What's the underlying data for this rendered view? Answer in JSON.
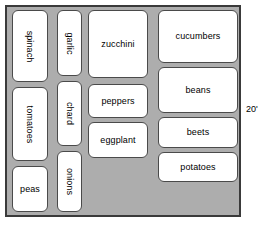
{
  "diagram": {
    "frame": {
      "fill_color": "#adadad",
      "border_color": "#3a3a3a"
    },
    "bed_style": {
      "fill_color": "#ffffff",
      "border_color": "#4a4a4a"
    },
    "dimension": {
      "right_label": "20'"
    },
    "beds": [
      {
        "name": "spinach",
        "label": "spinach",
        "orientation": "vertical",
        "column": 1,
        "x": 12,
        "y": 10,
        "w": 36,
        "h": 72
      },
      {
        "name": "tomatoes",
        "label": "tomatoes",
        "orientation": "vertical",
        "column": 1,
        "x": 12,
        "y": 87,
        "w": 36,
        "h": 74
      },
      {
        "name": "peas",
        "label": "peas",
        "orientation": "horizontal",
        "column": 1,
        "x": 12,
        "y": 166,
        "w": 36,
        "h": 46
      },
      {
        "name": "garlic",
        "label": "garlic",
        "orientation": "vertical",
        "column": 2,
        "x": 57,
        "y": 10,
        "w": 25,
        "h": 66
      },
      {
        "name": "chard",
        "label": "chard",
        "orientation": "vertical",
        "column": 2,
        "x": 57,
        "y": 81,
        "w": 25,
        "h": 65
      },
      {
        "name": "onions",
        "label": "onions",
        "orientation": "vertical",
        "column": 2,
        "x": 57,
        "y": 151,
        "w": 25,
        "h": 61
      },
      {
        "name": "zucchini",
        "label": "zucchini",
        "orientation": "horizontal",
        "column": 3,
        "x": 88,
        "y": 10,
        "w": 60,
        "h": 68
      },
      {
        "name": "peppers",
        "label": "peppers",
        "orientation": "horizontal",
        "column": 3,
        "x": 88,
        "y": 84,
        "w": 60,
        "h": 34
      },
      {
        "name": "eggplant",
        "label": "eggplant",
        "orientation": "horizontal",
        "column": 3,
        "x": 88,
        "y": 122,
        "w": 60,
        "h": 36
      },
      {
        "name": "cucumbers",
        "label": "cucumbers",
        "orientation": "horizontal",
        "column": 4,
        "x": 158,
        "y": 10,
        "w": 80,
        "h": 53
      },
      {
        "name": "beans",
        "label": "beans",
        "orientation": "horizontal",
        "column": 4,
        "x": 158,
        "y": 67,
        "w": 80,
        "h": 46
      },
      {
        "name": "beets",
        "label": "beets",
        "orientation": "horizontal",
        "column": 4,
        "x": 158,
        "y": 117,
        "w": 80,
        "h": 31
      },
      {
        "name": "potatoes",
        "label": "potatoes",
        "orientation": "horizontal",
        "column": 4,
        "x": 158,
        "y": 152,
        "w": 80,
        "h": 30
      }
    ]
  }
}
